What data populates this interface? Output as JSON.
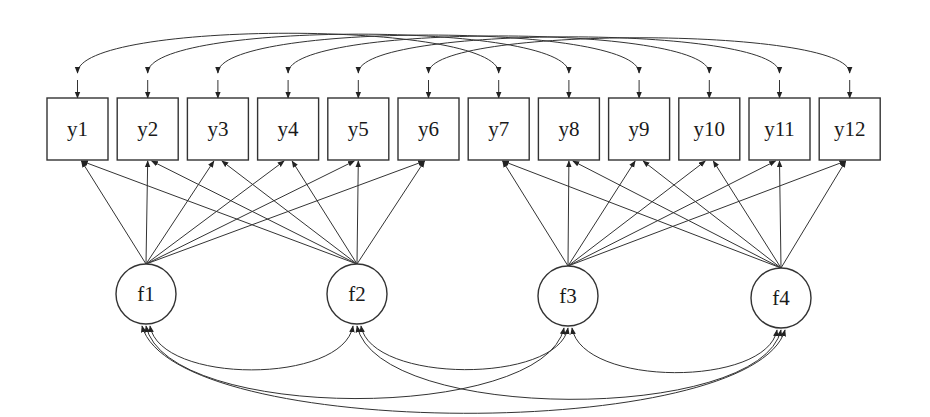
{
  "diagram": {
    "type": "structural-equation-model path diagram",
    "observed": [
      {
        "id": "y1",
        "label": "y1"
      },
      {
        "id": "y2",
        "label": "y2"
      },
      {
        "id": "y3",
        "label": "y3"
      },
      {
        "id": "y4",
        "label": "y4"
      },
      {
        "id": "y5",
        "label": "y5"
      },
      {
        "id": "y6",
        "label": "y6"
      },
      {
        "id": "y7",
        "label": "y7"
      },
      {
        "id": "y8",
        "label": "y8"
      },
      {
        "id": "y9",
        "label": "y9"
      },
      {
        "id": "y10",
        "label": "y10"
      },
      {
        "id": "y11",
        "label": "y11"
      },
      {
        "id": "y12",
        "label": "y12"
      }
    ],
    "latent": [
      {
        "id": "f1",
        "label": "f1",
        "cx": 146,
        "cy": 294
      },
      {
        "id": "f2",
        "label": "f2",
        "cx": 357,
        "cy": 294
      },
      {
        "id": "f3",
        "label": "f3",
        "cx": 568,
        "cy": 296
      },
      {
        "id": "f4",
        "label": "f4",
        "cx": 781,
        "cy": 298
      }
    ],
    "loadings": [
      {
        "factor": "f1",
        "indicators": [
          "y1",
          "y2",
          "y3",
          "y4",
          "y5",
          "y6"
        ]
      },
      {
        "factor": "f2",
        "indicators": [
          "y1",
          "y2",
          "y3",
          "y4",
          "y5",
          "y6"
        ]
      },
      {
        "factor": "f3",
        "indicators": [
          "y7",
          "y8",
          "y9",
          "y10",
          "y11",
          "y12"
        ]
      },
      {
        "factor": "f4",
        "indicators": [
          "y7",
          "y8",
          "y9",
          "y10",
          "y11",
          "y12"
        ]
      }
    ],
    "residual_covariances": [
      [
        "y1",
        "y7"
      ],
      [
        "y2",
        "y8"
      ],
      [
        "y3",
        "y9"
      ],
      [
        "y4",
        "y10"
      ],
      [
        "y5",
        "y11"
      ],
      [
        "y6",
        "y12"
      ]
    ],
    "factor_covariances": [
      [
        "f1",
        "f2"
      ],
      [
        "f2",
        "f3"
      ],
      [
        "f3",
        "f4"
      ],
      [
        "f1",
        "f3"
      ],
      [
        "f2",
        "f4"
      ],
      [
        "f1",
        "f4"
      ]
    ]
  }
}
